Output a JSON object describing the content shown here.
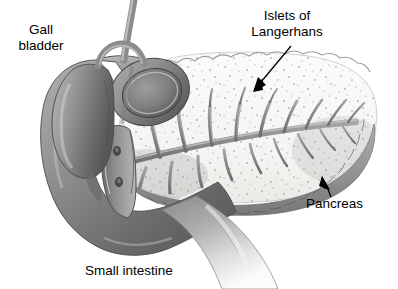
{
  "figure": {
    "background_color": "#ffffff",
    "width": 398,
    "height": 289
  },
  "labels": {
    "gall_bladder": {
      "line1": "Gall",
      "line2": "bladder"
    },
    "islets": {
      "line1": "Islets of",
      "line2": "Langerhans"
    },
    "pancreas": {
      "text": "Pancreas"
    },
    "small_intestine": {
      "text": "Small intestine"
    }
  },
  "annotations": {
    "islets_arrow": {
      "name": "islets-arrow",
      "from_x": 291,
      "from_y": 46,
      "to_x": 253,
      "to_y": 92
    },
    "pancreas_arrow": {
      "name": "pancreas-arrow",
      "from_x": 331,
      "from_y": 196,
      "to_x": 322,
      "to_y": 176
    }
  },
  "colors": {
    "outline": "#3a3a3a",
    "organ_mid_gray": "#8d8d8d",
    "organ_dark_gray": "#5e5e5e",
    "organ_light_gray": "#b9b9b9",
    "pancreas_fill": "#f6f6f4",
    "pancreas_speckle": "#7a7a7a",
    "duct_gray": "#8a8a8a",
    "text": "#000000"
  },
  "structures": [
    {
      "name": "gallbladder",
      "label_ref": "gall_bladder"
    },
    {
      "name": "cystic-duct"
    },
    {
      "name": "common-bile-duct"
    },
    {
      "name": "duodenum-loop",
      "label_ref": "small_intestine"
    },
    {
      "name": "duodenum-cutaway-panel"
    },
    {
      "name": "duodenal-papilla-major"
    },
    {
      "name": "duodenal-papilla-minor"
    },
    {
      "name": "pancreas-body",
      "label_ref": "pancreas"
    },
    {
      "name": "pancreatic-duct"
    },
    {
      "name": "islets-of-langerhans-region",
      "label_ref": "islets"
    }
  ]
}
